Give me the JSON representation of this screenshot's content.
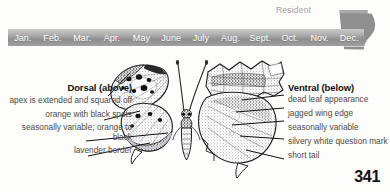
{
  "status": {
    "residency_label": "Resident",
    "map_region": "georgia-state-outline",
    "map_fill_color": "#8f8f8f"
  },
  "flight_calendar": {
    "months": [
      "Jan.",
      "Feb.",
      "Mar.",
      "Apr.",
      "May",
      "June",
      "July",
      "Aug.",
      "Sept.",
      "Oct.",
      "Nov.",
      "Dec."
    ],
    "bar_color": "#9a9a9a",
    "text_color": "#ffffff"
  },
  "illustration": {
    "subject": "question-mark-butterfly",
    "left_view": "dorsal",
    "right_view": "ventral"
  },
  "dorsal": {
    "heading": "Dorsal (above)",
    "callouts": [
      "apex is extended and squared off",
      "orange with black spots",
      "seasonally variable; orange to black",
      "lavender border"
    ]
  },
  "ventral": {
    "heading": "Ventral (below)",
    "callouts": [
      "dead leaf appearance",
      "jagged wing edge",
      "seasonally variable",
      "silvery white question mark",
      "short tail"
    ]
  },
  "footer": {
    "page_number": "341"
  }
}
